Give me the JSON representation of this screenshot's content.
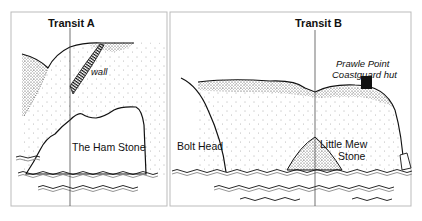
{
  "panels": [
    {
      "id": "transit-a",
      "title": "Transit A",
      "labels": {
        "wall": "wall",
        "rock": "The Ham Stone"
      }
    },
    {
      "id": "transit-b",
      "title": "Transit B",
      "labels": {
        "headland": "Bolt Head",
        "rock_line1": "Little Mew",
        "rock_line2": "Stone",
        "hut_line1": "Prawle Point",
        "hut_line2": "Coastguard hut"
      }
    }
  ],
  "colors": {
    "ink": "#111111",
    "frame": "#bbbbbb",
    "background": "#ffffff"
  }
}
